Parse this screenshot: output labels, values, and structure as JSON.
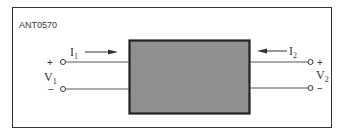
{
  "figure_id": "ANT0570",
  "network": {
    "box_color": "#8f8f8f",
    "border_color": "#222222"
  },
  "port1": {
    "current": "I",
    "current_sub": "1",
    "voltage": "V",
    "voltage_sub": "1",
    "plus": "+",
    "minus": "−"
  },
  "port2": {
    "current": "I",
    "current_sub": "2",
    "voltage": "V",
    "voltage_sub": "2",
    "plus": "+",
    "minus": "−"
  }
}
